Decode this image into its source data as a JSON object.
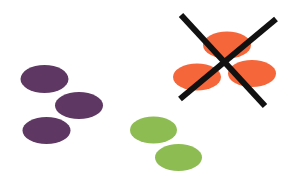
{
  "canvas": {
    "width": 289,
    "height": 189,
    "background": "#ffffff"
  },
  "colors": {
    "purple": "#5e3763",
    "green": "#8cbc52",
    "orange": "#f5673a",
    "cross": "#111111"
  },
  "groups": [
    {
      "name": "purple-group",
      "color": "#5e3763",
      "ellipses": [
        {
          "cx": 44.5,
          "cy": 79,
          "rx": 24,
          "ry": 14
        },
        {
          "cx": 79,
          "cy": 105.5,
          "rx": 24,
          "ry": 13.5
        },
        {
          "cx": 46.5,
          "cy": 130.5,
          "rx": 24,
          "ry": 13.5
        }
      ]
    },
    {
      "name": "green-group",
      "color": "#8cbc52",
      "ellipses": [
        {
          "cx": 153.5,
          "cy": 130,
          "rx": 23.5,
          "ry": 13.5
        },
        {
          "cx": 178.5,
          "cy": 157.5,
          "rx": 23.5,
          "ry": 13.5
        }
      ]
    },
    {
      "name": "orange-group",
      "color": "#f5673a",
      "ellipses": [
        {
          "cx": 227,
          "cy": 45,
          "rx": 24,
          "ry": 13.5
        },
        {
          "cx": 197,
          "cy": 77,
          "rx": 24,
          "ry": 13.5
        },
        {
          "cx": 252,
          "cy": 73.5,
          "rx": 24,
          "ry": 13.5
        }
      ]
    }
  ],
  "cross": {
    "color": "#111111",
    "stroke_width": 6,
    "lines": [
      {
        "x1": 181,
        "y1": 15,
        "x2": 265,
        "y2": 106
      },
      {
        "x1": 276,
        "y1": 19,
        "x2": 180,
        "y2": 99
      }
    ]
  }
}
